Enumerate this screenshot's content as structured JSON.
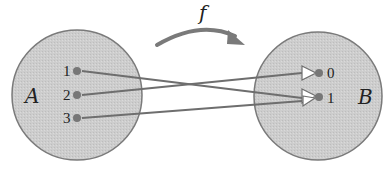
{
  "diagram": {
    "type": "function-mapping",
    "function_label": "f",
    "domain_set": {
      "name": "A",
      "elements": [
        "1",
        "2",
        "3"
      ]
    },
    "codomain_set": {
      "name": "B",
      "elements": [
        "0",
        "1"
      ]
    },
    "mappings": [
      {
        "from": "1",
        "to": "1"
      },
      {
        "from": "2",
        "to": "0"
      },
      {
        "from": "3",
        "to": "1"
      }
    ],
    "colors": {
      "set_fill": "#cfcfcf",
      "set_stroke": "#7a7a7a",
      "line": "#6e6e6e",
      "dot": "#777777",
      "arrow": "#7a7a7a"
    }
  }
}
